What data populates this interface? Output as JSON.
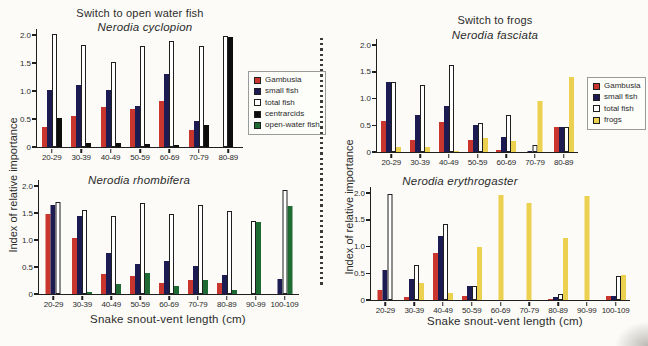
{
  "headers": {
    "left": "Switch to open water fish",
    "right": "Switch to frogs"
  },
  "axis": {
    "y_label_left": "Index of relative importance",
    "y_label_right": "Index of relative importance",
    "x_label_left": "Snake snout-vent length (cm)",
    "x_label_right": "Snake snout-vent length (cm)",
    "y_ticks": [
      "0",
      "0.5",
      "1.0",
      "1.5",
      "2.0"
    ]
  },
  "colors": {
    "gambusia_red": "#c8362e",
    "small_fish_navy": "#1c1c52",
    "total_fish_white": "#ffffff",
    "centrarcids_black": "#0d0d0d",
    "open_water_fish_green": "#1e6b33",
    "frogs_yellow": "#ecd04f",
    "axis_ink": "#1f1f1f"
  },
  "legends": {
    "left": {
      "items": [
        {
          "label": "Gambusia",
          "color": "#c8362e"
        },
        {
          "label": "small fish",
          "color": "#1c1c52"
        },
        {
          "label": "total fish",
          "color": "#ffffff"
        },
        {
          "label": "centrarcids",
          "color": "#0d0d0d"
        },
        {
          "label": "open-water fish",
          "color": "#1e6b33"
        }
      ]
    },
    "right": {
      "items": [
        {
          "label": "Gambusia",
          "color": "#c8362e"
        },
        {
          "label": "small fish",
          "color": "#1c1c52"
        },
        {
          "label": "total fish",
          "color": "#ffffff"
        },
        {
          "label": "frogs",
          "color": "#ecd04f"
        }
      ]
    }
  },
  "chart_data": [
    {
      "type": "bar",
      "title": "Nerodia cyclopion",
      "categories": [
        "20-29",
        "30-39",
        "40-49",
        "50-59",
        "60-69",
        "70-79",
        "80-89"
      ],
      "ylim": [
        0,
        2.0
      ],
      "ylabel": "Index of relative importance",
      "series": [
        {
          "name": "Gambusia",
          "color": "#c8362e",
          "values": [
            0.35,
            0.55,
            0.71,
            0.68,
            0.82,
            0.3,
            0
          ]
        },
        {
          "name": "small fish",
          "color": "#1c1c52",
          "values": [
            1.02,
            1.1,
            1.01,
            0.74,
            1.3,
            0.47,
            0
          ]
        },
        {
          "name": "total fish",
          "color": "#ffffff",
          "values": [
            2.02,
            1.82,
            1.51,
            1.8,
            1.89,
            1.8,
            1.98
          ]
        },
        {
          "name": "centrarcids",
          "color": "#0d0d0d",
          "values": [
            0.52,
            0.07,
            0.07,
            0.06,
            0.04,
            0.39,
            1.96
          ]
        },
        {
          "name": "open-water fish",
          "color": "#1e6b33",
          "values": [
            0,
            0,
            0,
            0,
            0,
            0,
            0
          ]
        }
      ]
    },
    {
      "type": "bar",
      "title": "Nerodia rhombifera",
      "categories": [
        "20-29",
        "30-39",
        "40-49",
        "50-59",
        "60-69",
        "70-79",
        "80-89",
        "90-99",
        "100-109"
      ],
      "ylim": [
        0,
        2.0
      ],
      "xlabel": "Snake snout-vent length (cm)",
      "series": [
        {
          "name": "Gambusia",
          "color": "#c8362e",
          "values": [
            1.48,
            1.04,
            0.37,
            0.34,
            0.21,
            0.26,
            0.2,
            0,
            0
          ]
        },
        {
          "name": "small fish",
          "color": "#1c1c52",
          "values": [
            1.65,
            1.44,
            0.76,
            0.55,
            0.61,
            0.52,
            0.35,
            0,
            0.28
          ]
        },
        {
          "name": "total fish",
          "color": "#ffffff",
          "values": [
            1.7,
            1.55,
            1.45,
            1.68,
            1.48,
            1.65,
            1.54,
            1.35,
            1.93
          ]
        },
        {
          "name": "centrarcids",
          "color": "#0d0d0d",
          "values": [
            0,
            0,
            0,
            0,
            0,
            0,
            0,
            0,
            0
          ]
        },
        {
          "name": "open-water fish",
          "color": "#1e6b33",
          "values": [
            0,
            0.03,
            0.18,
            0.39,
            0.15,
            0.26,
            0.07,
            1.34,
            1.63
          ]
        }
      ]
    },
    {
      "type": "bar",
      "title": "Nerodia fasciata",
      "categories": [
        "20-29",
        "30-39",
        "40-49",
        "50-59",
        "60-69",
        "70-79",
        "80-89"
      ],
      "ylim": [
        0,
        2.0
      ],
      "series": [
        {
          "name": "Gambusia",
          "color": "#c8362e",
          "values": [
            0.58,
            0.22,
            0.57,
            0.22,
            0.04,
            0,
            0.46
          ]
        },
        {
          "name": "small fish",
          "color": "#1c1c52",
          "values": [
            1.3,
            0.7,
            0.86,
            0.5,
            0.28,
            0.02,
            0.47
          ]
        },
        {
          "name": "total fish",
          "color": "#ffffff",
          "values": [
            1.3,
            1.25,
            1.62,
            0.55,
            0.7,
            0.13,
            0.47
          ]
        },
        {
          "name": "frogs",
          "color": "#ecd04f",
          "values": [
            0.1,
            0.09,
            0.02,
            0.27,
            0.2,
            0.96,
            1.41
          ]
        }
      ]
    },
    {
      "type": "bar",
      "title": "Nerodia erythrogaster",
      "categories": [
        "20-29",
        "30-39",
        "40-49",
        "50-59",
        "60-69",
        "70-79",
        "80-89",
        "90-99",
        "100-109"
      ],
      "ylim": [
        0,
        2.0
      ],
      "xlabel": "Snake snout-vent length (cm)",
      "series": [
        {
          "name": "Gambusia",
          "color": "#c8362e",
          "values": [
            0.18,
            0.05,
            0.87,
            0.08,
            0,
            0,
            0.02,
            0,
            0.08
          ]
        },
        {
          "name": "small fish",
          "color": "#1c1c52",
          "values": [
            0.57,
            0.39,
            1.19,
            0.27,
            0,
            0,
            0.05,
            0,
            0.08
          ]
        },
        {
          "name": "total fish",
          "color": "#ffffff",
          "values": [
            1.99,
            0.65,
            1.43,
            0.26,
            0,
            0,
            0.12,
            0,
            0.44
          ]
        },
        {
          "name": "frogs",
          "color": "#ecd04f",
          "values": [
            0,
            0.32,
            0.13,
            1.0,
            1.96,
            1.82,
            1.16,
            1.95,
            0.47
          ]
        }
      ]
    }
  ]
}
